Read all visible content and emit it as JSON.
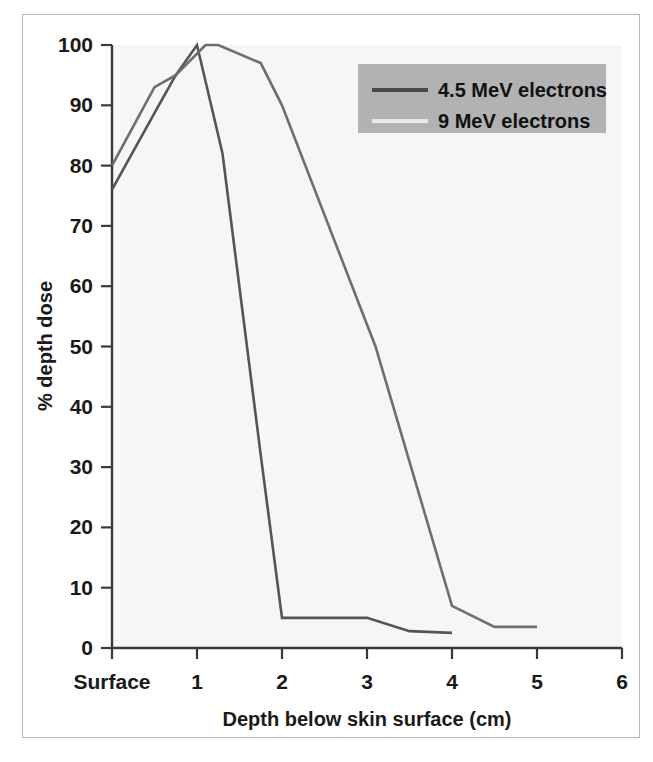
{
  "figure": {
    "background_color": "#ffffff",
    "frame_color": "#b8b8b8",
    "plot_background_color": "#f6f6f6"
  },
  "chart_data": {
    "type": "line",
    "title": "",
    "xlabel": "Depth below skin surface (cm)",
    "ylabel": "% depth dose",
    "xlim": [
      0,
      6
    ],
    "ylim": [
      0,
      100
    ],
    "grid": false,
    "legend_position": "top-right",
    "x_tick_values": [
      0,
      1,
      2,
      3,
      4,
      5,
      6
    ],
    "x_tick_labels": [
      "Surface",
      "1",
      "2",
      "3",
      "4",
      "5",
      "6"
    ],
    "y_tick_values": [
      0,
      10,
      20,
      30,
      40,
      50,
      60,
      70,
      80,
      90,
      100
    ],
    "y_tick_labels": [
      "0",
      "10",
      "20",
      "30",
      "40",
      "50",
      "60",
      "70",
      "80",
      "90",
      "100"
    ],
    "series": [
      {
        "name": "4.5 MeV electrons",
        "color": "#555555",
        "line_width": 2.6,
        "x": [
          0,
          0.55,
          0.75,
          1.0,
          1.3,
          1.75,
          2.0,
          3.0,
          3.5,
          4.0
        ],
        "y": [
          76,
          90,
          95,
          100,
          82,
          32,
          5,
          5,
          2.8,
          2.5
        ]
      },
      {
        "name": "9 MeV electrons",
        "color": "#6e6e6e",
        "line_width": 2.6,
        "x": [
          0,
          0.5,
          0.75,
          1.1,
          1.25,
          1.75,
          2.0,
          3.1,
          4.0,
          4.5,
          5.0
        ],
        "y": [
          80,
          93,
          95,
          100,
          100,
          97,
          90,
          50,
          7,
          3.5,
          3.5
        ]
      }
    ]
  },
  "legend": {
    "background_color": "#b2b2b2",
    "entries": [
      {
        "label": "4.5 MeV electrons",
        "swatch_color": "#4a4a4a"
      },
      {
        "label": "9 MeV electrons",
        "swatch_color": "#e9e9e9"
      }
    ]
  }
}
